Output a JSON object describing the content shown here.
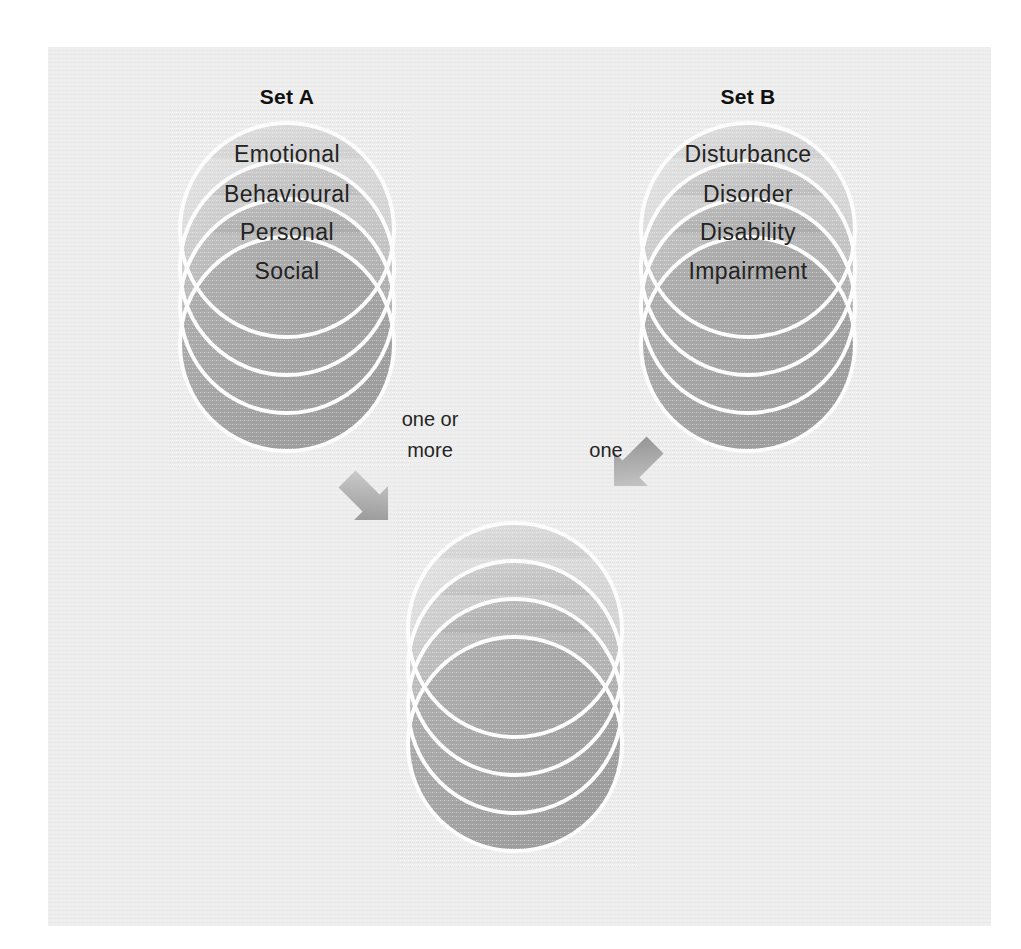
{
  "figure": {
    "background_color": "#ffffff",
    "panel_color": "#ededed",
    "ring_stroke_color": "#fdfdfd",
    "arrow_color": "#9a9a9a",
    "text_color": "#232323"
  },
  "sets": {
    "a": {
      "title": "Set A",
      "labels": [
        "Emotional",
        "Behavioural",
        "Personal",
        "Social"
      ],
      "fills": [
        "#d9d9d9",
        "#c8c8c8",
        "#b6b6b6",
        "#a4a4a4"
      ]
    },
    "b": {
      "title": "Set B",
      "labels": [
        "Disturbance",
        "Disorder",
        "Disability",
        "Impairment"
      ],
      "fills": [
        "#d9d9d9",
        "#c8c8c8",
        "#b6b6b6",
        "#a4a4a4"
      ]
    },
    "result": {
      "title": "",
      "labels": [
        "",
        "",
        "",
        ""
      ],
      "fills": [
        "#d9d9d9",
        "#c8c8c8",
        "#b6b6b6",
        "#a4a4a4"
      ]
    }
  },
  "connectors": {
    "left": {
      "label_line1": "one or",
      "label_line2": "more",
      "icon": "arrow-down-right-icon"
    },
    "right": {
      "label_line1": "one",
      "label_line2": "",
      "icon": "arrow-down-left-icon"
    }
  }
}
